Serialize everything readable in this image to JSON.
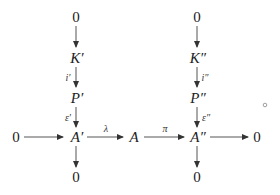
{
  "diagram": {
    "type": "commutative-diagram",
    "nodes": {
      "top_left_zero": "0",
      "k_prime": "K′",
      "p_prime": "P′",
      "a_prime": "A′",
      "bottom_left_zero": "0",
      "left_zero": "0",
      "a": "A",
      "top_right_zero": "0",
      "k_dprime": "K″",
      "p_dprime": "P″",
      "a_dprime": "A″",
      "bottom_right_zero": "0",
      "right_zero": "0"
    },
    "labels": {
      "i_prime": "i′",
      "epsilon_prime": "ε′",
      "lambda": "λ",
      "pi": "π",
      "i_dprime": "i″",
      "epsilon_dprime": "ε″"
    },
    "decoration": "∘"
  }
}
